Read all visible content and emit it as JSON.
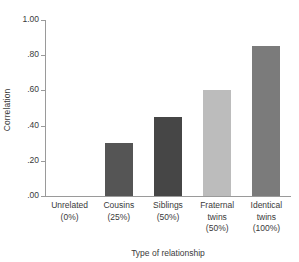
{
  "chart_data": {
    "type": "bar",
    "title": "",
    "xlabel": "Type of relationship",
    "ylabel": "Correlation",
    "categories": [
      "Unrelated\n(0%)",
      "Cousins\n(25%)",
      "Siblings\n(50%)",
      "Fraternal twins\n(50%)",
      "Identical twins\n(100%)"
    ],
    "values": [
      0.0,
      0.3,
      0.45,
      0.6,
      0.85
    ],
    "ylim": [
      0.0,
      1.0
    ],
    "yticks": [
      0.0,
      0.2,
      0.4,
      0.6,
      0.8,
      1.0
    ],
    "ytick_labels": [
      ".00",
      ".20",
      ".40",
      ".60",
      ".80",
      "1.00"
    ],
    "grid": false,
    "legend": "none",
    "bar_colors": [
      "#ffffff",
      "#555555",
      "#464646",
      "#bcbcbc",
      "#7b7b7b"
    ]
  },
  "axes": {
    "y_title": "Correlation",
    "x_title": "Type of relationship",
    "y_tick_labels": [
      "1.00",
      ".80",
      ".60",
      ".40",
      ".20",
      ".00"
    ]
  },
  "categories": [
    {
      "name": "Unrelated",
      "pct": "(0%)",
      "value": 0.0,
      "color": "#ffffff",
      "label_line1": "Unrelated",
      "label_line2": "(0%)",
      "label_line3": ""
    },
    {
      "name": "Cousins",
      "pct": "(25%)",
      "value": 0.3,
      "color": "#555555",
      "label_line1": "Cousins",
      "label_line2": "(25%)",
      "label_line3": ""
    },
    {
      "name": "Siblings",
      "pct": "(50%)",
      "value": 0.45,
      "color": "#464646",
      "label_line1": "Siblings",
      "label_line2": "(50%)",
      "label_line3": ""
    },
    {
      "name": "Fraternal twins",
      "pct": "(50%)",
      "value": 0.6,
      "color": "#bcbcbc",
      "label_line1": "Fraternal",
      "label_line2": "twins",
      "label_line3": "(50%)"
    },
    {
      "name": "Identical twins",
      "pct": "(100%)",
      "value": 0.85,
      "color": "#7b7b7b",
      "label_line1": "Identical",
      "label_line2": "twins",
      "label_line3": "(100%)"
    }
  ]
}
